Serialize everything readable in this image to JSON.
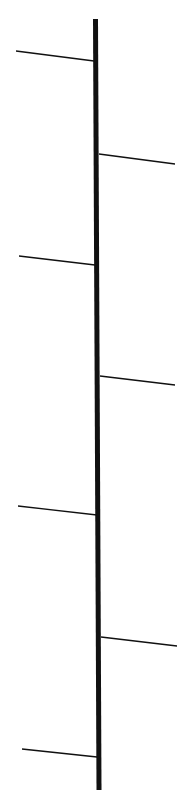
{
  "diagram": {
    "width": 195,
    "height": 799,
    "background": "#ffffff",
    "stroke_color": "#111111",
    "trunk": {
      "x1": 95.5,
      "y1": 19,
      "x2": 99,
      "y2": 790,
      "width": 5
    },
    "branches": [
      {
        "side": "left",
        "x1": 16,
        "y1": 51,
        "x2": 94,
        "y2": 61
      },
      {
        "side": "right",
        "x1": 99,
        "y1": 154,
        "x2": 175,
        "y2": 164
      },
      {
        "side": "left",
        "x1": 19,
        "y1": 256,
        "x2": 95,
        "y2": 265
      },
      {
        "side": "right",
        "x1": 100,
        "y1": 376,
        "x2": 175,
        "y2": 385
      },
      {
        "side": "left",
        "x1": 18,
        "y1": 506,
        "x2": 97,
        "y2": 515
      },
      {
        "side": "right",
        "x1": 101,
        "y1": 637,
        "x2": 177,
        "y2": 646
      },
      {
        "side": "left",
        "x1": 22,
        "y1": 749,
        "x2": 97,
        "y2": 757
      }
    ],
    "branch_width": 1.3
  }
}
